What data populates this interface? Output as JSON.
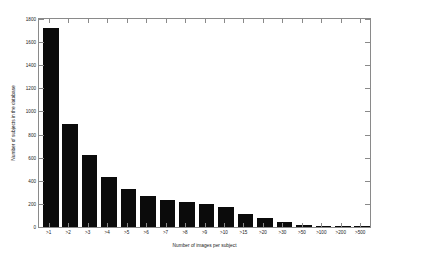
{
  "chart_data": {
    "type": "bar",
    "title": "",
    "xlabel": "Number of images per subject",
    "ylabel": "Number of subjects in the database",
    "categories": [
      ">1",
      ">2",
      ">3",
      ">4",
      ">5",
      ">6",
      ">7",
      ">8",
      ">9",
      ">10",
      ">15",
      ">20",
      ">30",
      ">50",
      ">100",
      ">200",
      ">500"
    ],
    "values": [
      1720,
      890,
      620,
      430,
      330,
      270,
      235,
      215,
      195,
      175,
      110,
      80,
      42,
      20,
      10,
      6,
      3
    ],
    "ylim": [
      0,
      1800
    ],
    "yticks": [
      0,
      200,
      400,
      600,
      800,
      1000,
      1200,
      1400,
      1600,
      1800
    ],
    "ytick_labels": [
      "0",
      "200",
      "400",
      "600",
      "800",
      "1000",
      "1200",
      "1400",
      "1600",
      "1800"
    ],
    "grid": false,
    "legend": null,
    "bar_color": "#0b0b0b",
    "axis_color": "#8a8a8a"
  }
}
